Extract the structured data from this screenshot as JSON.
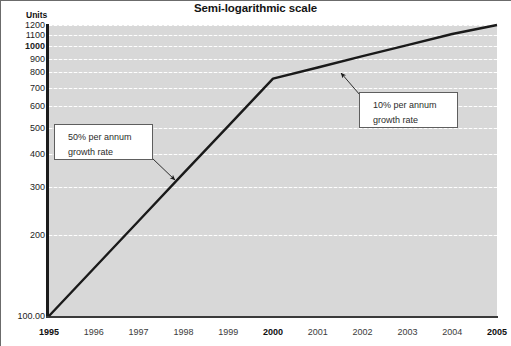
{
  "chart_data": {
    "type": "line",
    "title": "Semi-logarithmic scale",
    "xlabel": "",
    "ylabel": "Units",
    "yscale": "log",
    "ylim": [
      100,
      1200
    ],
    "grid": true,
    "legend": false,
    "x": [
      1995,
      1996,
      1997,
      1998,
      1999,
      2000,
      2001,
      2002,
      2003,
      2004,
      2005
    ],
    "xticklabels": [
      "1995",
      "1996",
      "1997",
      "1998",
      "1999",
      "2000",
      "2001",
      "2002",
      "2003",
      "2004",
      "2005"
    ],
    "bold_xticks": [
      "1995",
      "2000",
      "2005"
    ],
    "yticks": [
      100,
      200,
      300,
      400,
      500,
      600,
      700,
      800,
      900,
      1000,
      1100,
      1200
    ],
    "yticklabels": [
      "100.00",
      "200",
      "300",
      "400",
      "500",
      "600",
      "700",
      "800",
      "900",
      "1000",
      "1100",
      "1200"
    ],
    "bold_yticks": [
      "1000"
    ],
    "series": [
      {
        "name": "Units",
        "values": [
          100,
          150,
          225,
          338,
          506,
          759,
          835,
          919,
          1010,
          1111,
          1200
        ]
      }
    ],
    "annotations": [
      {
        "id": "growth-50",
        "lines": [
          "50% per annum",
          "growth rate"
        ],
        "text": "50% per annum growth rate",
        "segment_years": [
          1995,
          2000
        ],
        "growth_rate_percent": 50
      },
      {
        "id": "growth-10",
        "lines": [
          "10% per annum",
          "growth rate"
        ],
        "text": "10% per annum growth rate",
        "segment_years": [
          2000,
          2005
        ],
        "growth_rate_percent": 10
      }
    ],
    "colors": {
      "plot_background": "#d8d8d8",
      "gridline": "#ffffff",
      "series_line": "#1a1a1a",
      "axis": "#1c1c1c",
      "callout_background": "#ffffff",
      "callout_border": "#5e5e5e",
      "text": "#1d1d1d"
    }
  }
}
